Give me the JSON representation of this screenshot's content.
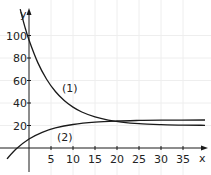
{
  "chart_data": {
    "type": "line",
    "title": "",
    "xlabel": "x",
    "ylabel": "y",
    "xlim": [
      -3,
      40
    ],
    "ylim": [
      -5,
      110
    ],
    "grid": false,
    "legend": "inline curve labels",
    "x_ticks": [
      5,
      10,
      15,
      20,
      25,
      30,
      35
    ],
    "y_ticks": [
      20,
      40,
      60,
      80,
      100
    ],
    "series": [
      {
        "name": "(1)",
        "description": "decreasing curve approaching ~20",
        "x": [
          -2,
          -1,
          0,
          2,
          4,
          6,
          8,
          10,
          12,
          15,
          18,
          21,
          25,
          30,
          35,
          40
        ],
        "y": [
          123.4,
          108.6,
          96,
          75.9,
          61.1,
          50.2,
          42.2,
          36.3,
          32.0,
          27.6,
          24.8,
          23.0,
          21.6,
          20.8,
          20.3,
          20.2
        ]
      },
      {
        "name": "(2)",
        "description": "increasing curve approaching ~25",
        "x": [
          -5,
          -3,
          0,
          3,
          6,
          10,
          15,
          20,
          25,
          30,
          40
        ],
        "y": [
          -9.7,
          -1.1,
          8,
          13.9,
          17.8,
          20.9,
          23.0,
          24.0,
          24.5,
          24.8,
          24.9
        ]
      }
    ],
    "annotations": [
      {
        "text": "(1)",
        "x": 8,
        "y": 52
      },
      {
        "text": "(2)",
        "x": 8,
        "y": 9
      }
    ],
    "intersection_approx": {
      "x": 22,
      "y": 23
    }
  },
  "labels": {
    "x_axis": "x",
    "y_axis": "y",
    "curve1": "(1)",
    "curve2": "(2)",
    "x_ticks": [
      "5",
      "10",
      "15",
      "20",
      "25",
      "30",
      "35"
    ],
    "y_ticks": [
      "20",
      "40",
      "60",
      "80",
      "100"
    ]
  },
  "colors": {
    "curve": "#1a1a1a",
    "axis": "#1a1a1a",
    "grid": "#eeeeee"
  }
}
